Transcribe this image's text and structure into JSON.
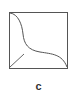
{
  "figure": {
    "panel_label": "c",
    "box": {
      "x": 9.5,
      "y": 12.5,
      "width": 58,
      "height": 56,
      "stroke": "#555555"
    },
    "curve": {
      "description": "S-shaped curve from top-left corner down to bottom-right corner",
      "stroke": "#555555"
    },
    "diagonal": {
      "x1": 10,
      "y1": 67,
      "x2": 24,
      "y2": 54,
      "stroke": "#666666"
    }
  }
}
